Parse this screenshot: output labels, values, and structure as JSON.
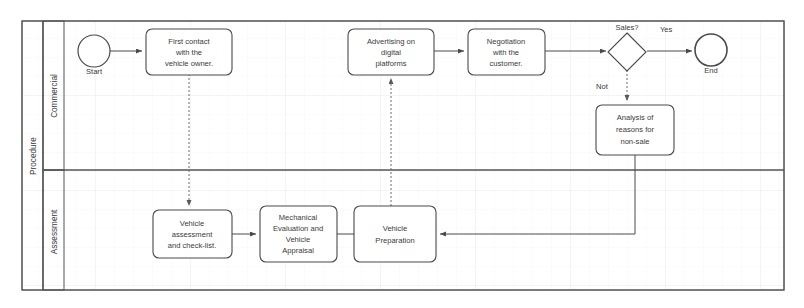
{
  "diagram": {
    "type": "bpmn-process",
    "pool": {
      "label": "Procedure"
    },
    "lanes": [
      {
        "id": "commercial",
        "label": "Commercial"
      },
      {
        "id": "assessment",
        "label": "Assessment"
      }
    ],
    "events": [
      {
        "id": "start",
        "kind": "start-event",
        "label": "Start",
        "lane": "commercial"
      },
      {
        "id": "end",
        "kind": "end-event",
        "label": "End",
        "lane": "commercial"
      }
    ],
    "gateways": [
      {
        "id": "sales",
        "kind": "exclusive-gateway",
        "label": "Sales?",
        "lane": "commercial"
      }
    ],
    "tasks": [
      {
        "id": "first-contact",
        "lane": "commercial",
        "label": "First contact with the vehicle owner.",
        "lines": [
          "First contact",
          "with the",
          "vehicle owner."
        ]
      },
      {
        "id": "advertising",
        "lane": "commercial",
        "label": "Advertising on digital platforms",
        "lines": [
          "Advertising on",
          "digital",
          "platforms"
        ]
      },
      {
        "id": "negotiation",
        "lane": "commercial",
        "label": "Negotiation with the customer.",
        "lines": [
          "Negotiation",
          "with the",
          "customer."
        ]
      },
      {
        "id": "analysis",
        "lane": "commercial",
        "label": "Analysis of reasons for non-sale",
        "lines": [
          "Analysis of",
          "reasons for",
          "non-sale"
        ]
      },
      {
        "id": "vehicle-assessment",
        "lane": "assessment",
        "label": "Vehicle assessment and check-list.",
        "lines": [
          "Vehicle",
          "assessment",
          "and check-list."
        ]
      },
      {
        "id": "mechanical-evaluation",
        "lane": "assessment",
        "label": "Mechanical Evaluation and Vehicle Appraisal",
        "lines": [
          "Mechanical",
          "Evaluation and",
          "Vehicle",
          "Appraisal"
        ]
      },
      {
        "id": "vehicle-preparation",
        "lane": "assessment",
        "label": "Vehicle Preparation",
        "lines": [
          "Vehicle",
          "Preparation"
        ]
      }
    ],
    "flow_labels": {
      "yes": "Yes",
      "not": "Not"
    },
    "colors": {
      "stroke": "#4a4a4a",
      "pool_stroke": "#555555",
      "text": "#3a3a3a",
      "background": "#ffffff",
      "grid": "#f0f0f2"
    }
  }
}
